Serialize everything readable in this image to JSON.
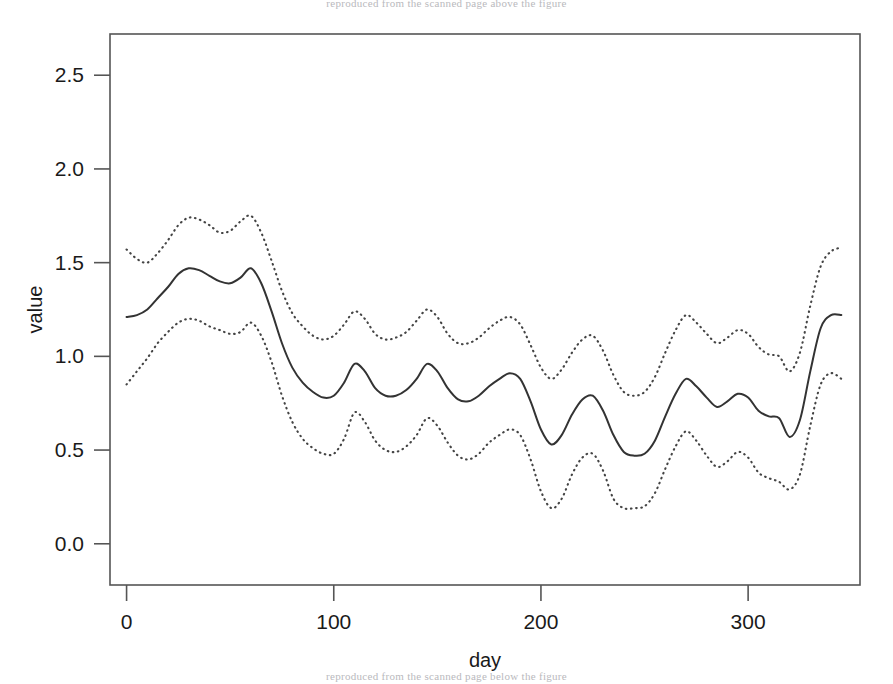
{
  "page": {
    "background": "#ffffff",
    "width": 893,
    "height": 684,
    "doc_text_top": "reproduced from the scanned page above the figure",
    "doc_text_bottom": "reproduced from the scanned page below the figure"
  },
  "chart_data": {
    "type": "line",
    "title": "",
    "subtitle": "",
    "xlabel": "day",
    "ylabel": "value",
    "xlim": [
      -8,
      354
    ],
    "ylim": [
      -0.22,
      2.72
    ],
    "xticks": [
      0,
      100,
      200,
      300
    ],
    "xtick_labels": [
      "0",
      "100",
      "200",
      "300"
    ],
    "yticks": [
      0.0,
      0.5,
      1.0,
      1.5,
      2.0,
      2.5
    ],
    "ytick_labels": [
      "0.0",
      "0.5",
      "1.0",
      "1.5",
      "2.0",
      "2.5"
    ],
    "grid": false,
    "legend": null,
    "box": true,
    "colors": {
      "fit_line": "#333333",
      "confidence_band": "#444444",
      "axis": "#555555",
      "text": "#1a1a1a"
    },
    "x": [
      0,
      5,
      10,
      15,
      20,
      25,
      30,
      35,
      40,
      45,
      50,
      55,
      60,
      65,
      70,
      75,
      80,
      85,
      90,
      95,
      100,
      105,
      110,
      115,
      120,
      125,
      130,
      135,
      140,
      145,
      150,
      155,
      160,
      165,
      170,
      175,
      180,
      185,
      190,
      195,
      200,
      205,
      210,
      215,
      220,
      225,
      230,
      235,
      240,
      245,
      250,
      255,
      260,
      265,
      270,
      275,
      280,
      285,
      290,
      295,
      300,
      305,
      310,
      315,
      320,
      325,
      330,
      335,
      340,
      345
    ],
    "series": [
      {
        "name": "fit",
        "style": "solid",
        "values": [
          1.21,
          1.22,
          1.25,
          1.31,
          1.37,
          1.44,
          1.47,
          1.46,
          1.43,
          1.4,
          1.39,
          1.42,
          1.47,
          1.39,
          1.24,
          1.07,
          0.94,
          0.86,
          0.81,
          0.78,
          0.79,
          0.86,
          0.96,
          0.92,
          0.83,
          0.79,
          0.79,
          0.82,
          0.88,
          0.96,
          0.92,
          0.83,
          0.77,
          0.76,
          0.79,
          0.84,
          0.88,
          0.91,
          0.88,
          0.76,
          0.61,
          0.53,
          0.58,
          0.69,
          0.77,
          0.79,
          0.71,
          0.58,
          0.49,
          0.47,
          0.48,
          0.55,
          0.68,
          0.8,
          0.88,
          0.84,
          0.78,
          0.73,
          0.76,
          0.8,
          0.78,
          0.71,
          0.68,
          0.67,
          0.57,
          0.66,
          0.92,
          1.15,
          1.22,
          1.22
        ]
      },
      {
        "name": "upper confidence band",
        "style": "dotted",
        "values": [
          1.57,
          1.52,
          1.5,
          1.55,
          1.62,
          1.7,
          1.74,
          1.73,
          1.7,
          1.66,
          1.67,
          1.72,
          1.75,
          1.66,
          1.51,
          1.35,
          1.23,
          1.16,
          1.11,
          1.09,
          1.11,
          1.17,
          1.24,
          1.2,
          1.12,
          1.09,
          1.1,
          1.13,
          1.19,
          1.25,
          1.21,
          1.12,
          1.07,
          1.07,
          1.1,
          1.15,
          1.19,
          1.21,
          1.17,
          1.06,
          0.94,
          0.88,
          0.93,
          1.02,
          1.09,
          1.11,
          1.03,
          0.9,
          0.81,
          0.79,
          0.81,
          0.89,
          1.02,
          1.14,
          1.22,
          1.18,
          1.12,
          1.07,
          1.1,
          1.14,
          1.12,
          1.05,
          1.01,
          1.0,
          0.92,
          1.02,
          1.27,
          1.48,
          1.56,
          1.58
        ]
      },
      {
        "name": "lower confidence band",
        "style": "dotted",
        "values": [
          0.85,
          0.92,
          0.99,
          1.07,
          1.13,
          1.18,
          1.2,
          1.19,
          1.16,
          1.14,
          1.12,
          1.13,
          1.18,
          1.11,
          0.97,
          0.79,
          0.65,
          0.56,
          0.51,
          0.48,
          0.48,
          0.56,
          0.7,
          0.65,
          0.55,
          0.5,
          0.49,
          0.52,
          0.58,
          0.67,
          0.63,
          0.54,
          0.47,
          0.45,
          0.48,
          0.54,
          0.58,
          0.61,
          0.58,
          0.45,
          0.28,
          0.19,
          0.24,
          0.37,
          0.46,
          0.48,
          0.39,
          0.24,
          0.19,
          0.19,
          0.2,
          0.27,
          0.4,
          0.52,
          0.6,
          0.55,
          0.47,
          0.41,
          0.44,
          0.49,
          0.46,
          0.38,
          0.35,
          0.33,
          0.29,
          0.37,
          0.63,
          0.85,
          0.91,
          0.88
        ]
      }
    ]
  }
}
